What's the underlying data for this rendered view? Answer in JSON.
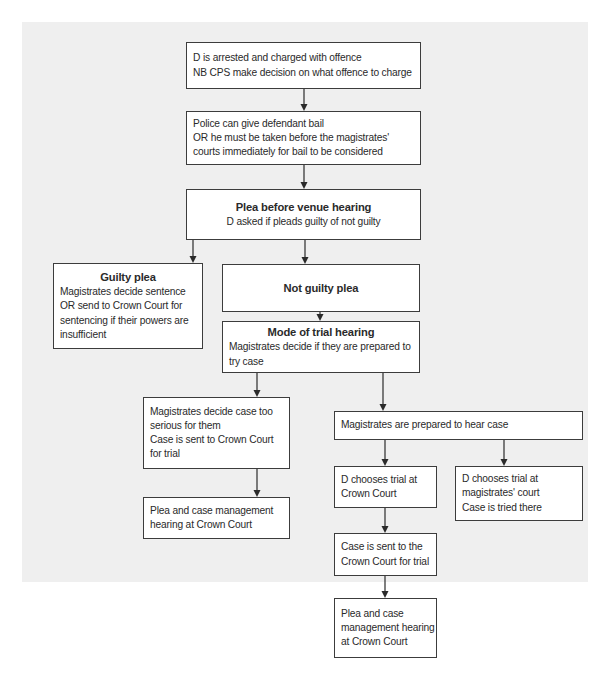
{
  "diagram": {
    "type": "flowchart",
    "background_color": "#efefef",
    "nodes": {
      "arrest": {
        "lines": [
          "D is arrested and charged with offence",
          "NB CPS make decision on what offence to charge"
        ]
      },
      "bail": {
        "lines": [
          "Police can give defendant bail",
          "OR he must be taken before the magistrates'",
          "courts immediately for bail to be considered"
        ]
      },
      "plea_before_venue": {
        "title": "Plea before venue hearing",
        "lines": [
          "D asked if pleads guilty of not guilty"
        ]
      },
      "guilty_plea": {
        "title": "Guilty plea",
        "lines": [
          "Magistrates decide sentence",
          "OR send to Crown Court for",
          "sentencing if their powers are",
          "insufficient"
        ]
      },
      "not_guilty_plea": {
        "title": "Not guilty plea"
      },
      "mode_of_trial": {
        "title": "Mode of trial hearing",
        "lines": [
          "Magistrates decide if they are prepared to",
          "try case"
        ]
      },
      "too_serious": {
        "lines": [
          "Magistrates decide case too",
          "serious for them",
          "Case is sent to Crown Court",
          "for trial"
        ]
      },
      "pcmh_left": {
        "lines": [
          "Plea and case management",
          "hearing at Crown Court"
        ]
      },
      "prepared": {
        "lines": [
          "Magistrates are prepared to hear case"
        ]
      },
      "chooses_crown": {
        "lines": [
          "D chooses trial at",
          "Crown Court"
        ]
      },
      "chooses_magistrates": {
        "lines": [
          "D chooses trial at",
          "magistrates' court",
          "Case is tried there"
        ]
      },
      "sent_to_crown": {
        "lines": [
          "Case is sent to the",
          "Crown Court for trial"
        ]
      },
      "pcmh_right": {
        "lines": [
          "Plea and case",
          "management hearing",
          "at Crown Court"
        ]
      }
    },
    "edges": [
      [
        "arrest",
        "bail"
      ],
      [
        "bail",
        "plea_before_venue"
      ],
      [
        "plea_before_venue",
        "guilty_plea"
      ],
      [
        "plea_before_venue",
        "not_guilty_plea"
      ],
      [
        "not_guilty_plea",
        "mode_of_trial"
      ],
      [
        "mode_of_trial",
        "too_serious"
      ],
      [
        "mode_of_trial",
        "prepared"
      ],
      [
        "too_serious",
        "pcmh_left"
      ],
      [
        "prepared",
        "chooses_crown"
      ],
      [
        "prepared",
        "chooses_magistrates"
      ],
      [
        "chooses_crown",
        "sent_to_crown"
      ],
      [
        "sent_to_crown",
        "pcmh_right"
      ]
    ]
  }
}
